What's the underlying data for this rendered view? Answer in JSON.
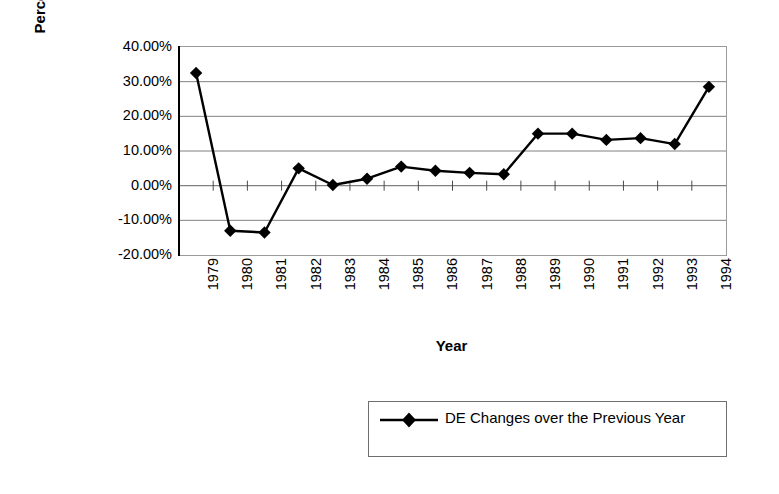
{
  "chart_data": {
    "type": "line",
    "title": "",
    "xlabel": "Year",
    "ylabel": "Percentage",
    "categories": [
      "1979",
      "1980",
      "1981",
      "1982",
      "1983",
      "1984",
      "1985",
      "1986",
      "1987",
      "1988",
      "1989",
      "1990",
      "1991",
      "1992",
      "1993",
      "1994"
    ],
    "series": [
      {
        "name": "DE Changes over the Previous Year",
        "values": [
          0.325,
          -0.13,
          -0.135,
          0.05,
          0.002,
          0.02,
          0.055,
          0.043,
          0.037,
          0.033,
          0.15,
          0.15,
          0.132,
          0.137,
          0.12,
          0.285
        ],
        "marker": "diamond",
        "color": "#000000"
      }
    ],
    "ylim": [
      -0.2,
      0.4
    ],
    "y_ticks": [
      0.4,
      0.3,
      0.2,
      0.1,
      0.0,
      -0.1,
      -0.2
    ],
    "y_tick_labels": [
      "40.00%",
      "30.00%",
      "20.00%",
      "10.00%",
      "0.00%",
      "-10.00%",
      "-20.00%"
    ],
    "grid": true,
    "grid_axis": "y",
    "legend_position": "bottom-right",
    "x_tick_rotation": 90
  },
  "axes": {
    "y_title": "Percentage",
    "x_title": "Year"
  },
  "legend": {
    "entries": [
      {
        "label": "DE Changes over the Previous Year",
        "marker": "diamond-line-marker",
        "color": "#000000"
      }
    ]
  },
  "colors": {
    "series": "#000000",
    "gridline": "#808080",
    "plot_border": "#9a9a9a",
    "background": "#ffffff"
  }
}
